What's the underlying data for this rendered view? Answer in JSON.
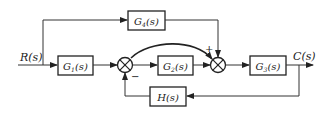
{
  "diagram": {
    "type": "control-system-block-diagram",
    "input": {
      "label": "R(s)",
      "main": "R",
      "arg": "(s)"
    },
    "output": {
      "label": "C(s)",
      "main": "C",
      "arg": "(s)"
    },
    "blocks": {
      "g1": {
        "main": "G",
        "sub": "1",
        "arg": "(s)"
      },
      "g2": {
        "main": "G",
        "sub": "2",
        "arg": "(s)"
      },
      "g3": {
        "main": "G",
        "sub": "3",
        "arg": "(s)"
      },
      "g4": {
        "main": "G",
        "sub": "4",
        "arg": "(s)"
      },
      "h": {
        "main": "H",
        "arg": "(s)"
      }
    },
    "summing_junctions": {
      "s1": {
        "feedback_sign": "−"
      },
      "s2": {
        "feedforward_sign": "+"
      }
    },
    "colors": {
      "line": "#333333",
      "background": "#ffffff"
    }
  }
}
